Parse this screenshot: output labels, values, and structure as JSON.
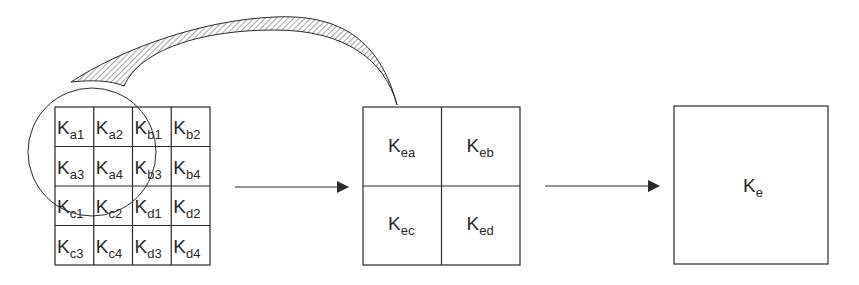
{
  "diagram": {
    "grid": {
      "symbol": "K",
      "cells": [
        [
          "a1",
          "a2",
          "b1",
          "b2"
        ],
        [
          "a3",
          "a4",
          "b3",
          "b4"
        ],
        [
          "c1",
          "c2",
          "d1",
          "d2"
        ],
        [
          "c3",
          "c4",
          "d3",
          "d4"
        ]
      ]
    },
    "middle": {
      "symbol": "K",
      "cells": [
        [
          "ea",
          "eb"
        ],
        [
          "ec",
          "ed"
        ]
      ]
    },
    "final": {
      "symbol": "K",
      "subscript": "e"
    },
    "colors": {
      "stroke": "#2a2a2a",
      "background": "#ffffff"
    }
  }
}
